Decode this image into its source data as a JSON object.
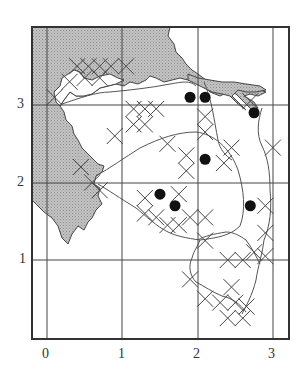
{
  "map": {
    "type": "grid distribution map",
    "axes": {
      "x_ticks": [
        "0",
        "1",
        "2",
        "3"
      ],
      "y_ticks": [
        "1",
        "2",
        "3"
      ]
    },
    "legend_symbols": {
      "cross": "open cross marker (x)",
      "dot": "filled circle marker"
    },
    "colors": {
      "sea_fill": "#b8b8b8",
      "land_fill": "#ffffff",
      "line": "#444444",
      "frame": "#333333",
      "dot": "#111111"
    }
  },
  "chart_data": {
    "type": "scatter",
    "title": "",
    "xlabel": "",
    "ylabel": "",
    "xlim": [
      -0.2,
      3.2
    ],
    "ylim": [
      -0.1,
      3.8
    ],
    "grid": true,
    "x_ticks": [
      0,
      1,
      2,
      3
    ],
    "y_ticks": [
      1,
      2,
      3
    ],
    "series": [
      {
        "name": "dots",
        "marker": "filled-circle",
        "points": [
          [
            1.9,
            3.1
          ],
          [
            2.1,
            3.1
          ],
          [
            2.75,
            2.9
          ],
          [
            2.1,
            2.3
          ],
          [
            1.5,
            1.85
          ],
          [
            1.7,
            1.7
          ],
          [
            2.7,
            1.7
          ]
        ]
      },
      {
        "name": "crosses",
        "marker": "x",
        "points": [
          [
            0.4,
            3.5
          ],
          [
            0.55,
            3.5
          ],
          [
            0.7,
            3.5
          ],
          [
            0.85,
            3.5
          ],
          [
            0.5,
            3.35
          ],
          [
            0.7,
            3.35
          ],
          [
            1.05,
            3.5
          ],
          [
            0.1,
            3.1
          ],
          [
            0.3,
            3.3
          ],
          [
            0.9,
            2.6
          ],
          [
            1.15,
            2.95
          ],
          [
            1.3,
            2.95
          ],
          [
            1.45,
            2.95
          ],
          [
            1.15,
            2.75
          ],
          [
            1.3,
            2.75
          ],
          [
            1.6,
            2.5
          ],
          [
            2.1,
            2.85
          ],
          [
            2.1,
            2.65
          ],
          [
            2.45,
            2.45
          ],
          [
            2.7,
            3.05
          ],
          [
            3.0,
            2.45
          ],
          [
            1.85,
            2.35
          ],
          [
            1.85,
            2.15
          ],
          [
            2.35,
            2.25
          ],
          [
            0.45,
            2.2
          ],
          [
            0.6,
            2.0
          ],
          [
            0.7,
            1.9
          ],
          [
            1.3,
            1.8
          ],
          [
            1.3,
            1.6
          ],
          [
            1.45,
            1.55
          ],
          [
            1.6,
            1.45
          ],
          [
            1.75,
            1.45
          ],
          [
            1.9,
            1.55
          ],
          [
            1.75,
            1.85
          ],
          [
            2.1,
            1.55
          ],
          [
            2.1,
            1.25
          ],
          [
            2.9,
            1.7
          ],
          [
            2.9,
            1.35
          ],
          [
            2.9,
            1.05
          ],
          [
            2.75,
            1.1
          ],
          [
            2.6,
            1.0
          ],
          [
            2.4,
            1.0
          ],
          [
            1.9,
            0.75
          ],
          [
            2.1,
            0.5
          ],
          [
            2.3,
            0.45
          ],
          [
            2.5,
            0.45
          ],
          [
            2.65,
            0.4
          ],
          [
            2.4,
            0.25
          ],
          [
            2.6,
            0.25
          ],
          [
            2.45,
            0.65
          ]
        ]
      }
    ]
  }
}
